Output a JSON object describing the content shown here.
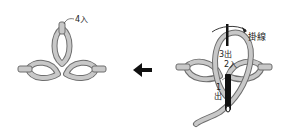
{
  "diagram": {
    "left_panel": {
      "labels": {
        "step4": "4入"
      }
    },
    "arrow": {
      "direction": "left",
      "icon": "arrow-left-icon"
    },
    "right_panel": {
      "labels": {
        "wrap_thread": "掛線",
        "step3": "3出",
        "step2": "2入",
        "step1_num": "1",
        "step1_char": "出"
      }
    },
    "colors": {
      "thread_fill": "#c8c8c8",
      "thread_stroke": "#6e6e6e",
      "needle": "#111111",
      "text": "#222222"
    }
  }
}
